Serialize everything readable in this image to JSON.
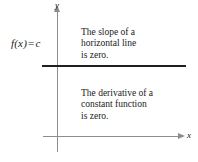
{
  "figure": {
    "function_label": {
      "fname": "f(x)",
      "operator": "=",
      "value": "c"
    },
    "axes": {
      "y_label": "y",
      "x_label": "x"
    },
    "notes": {
      "top": [
        "The slope of a",
        "horizontal line",
        "is zero."
      ],
      "bottom": [
        "The derivative of a",
        "constant function",
        "is zero."
      ]
    },
    "colors": {
      "background": "#ffffff",
      "axis": "#8d8d8d",
      "curve": "#231f20",
      "text": "#1a1a1a"
    }
  },
  "chart_data": {
    "type": "line",
    "title": "",
    "xlabel": "x",
    "ylabel": "y",
    "series": [
      {
        "name": "f(x) = c",
        "equation": "f(x) = c",
        "description": "horizontal constant-function line",
        "x": [
          -1.2,
          10.0
        ],
        "values": [
          5.5,
          5.5
        ]
      }
    ],
    "xlim": [
      -1.2,
      10.5
    ],
    "ylim": [
      -1.5,
      9.5
    ],
    "grid": false,
    "legend": false,
    "annotations": [
      "The slope of a horizontal line is zero.",
      "The derivative of a constant function is zero."
    ]
  }
}
